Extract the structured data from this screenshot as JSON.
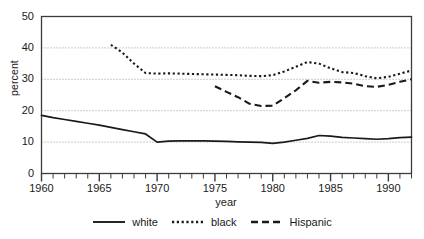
{
  "chart_data": {
    "type": "line",
    "title": "",
    "xlabel": "year",
    "ylabel": "percent",
    "xlim": [
      1960,
      1992
    ],
    "ylim": [
      0,
      50
    ],
    "yticks": [
      0,
      10,
      20,
      30,
      40,
      50
    ],
    "xticks_major": [
      1960,
      1965,
      1970,
      1975,
      1980,
      1985,
      1990
    ],
    "xticks_minor_step": 1,
    "grid": "horizontal-dotted",
    "legend_position": "below-bottom-center",
    "series": [
      {
        "name": "white",
        "style": "solid",
        "x": [
          1960,
          1961,
          1962,
          1963,
          1964,
          1965,
          1966,
          1967,
          1968,
          1969,
          1970,
          1971,
          1972,
          1973,
          1974,
          1975,
          1976,
          1977,
          1978,
          1979,
          1980,
          1981,
          1982,
          1983,
          1984,
          1985,
          1986,
          1987,
          1988,
          1989,
          1990,
          1991,
          1992
        ],
        "values": [
          18.5,
          17.8,
          17.2,
          16.6,
          16.0,
          15.4,
          14.7,
          14.0,
          13.3,
          12.6,
          10.0,
          10.3,
          10.4,
          10.4,
          10.4,
          10.3,
          10.2,
          10.1,
          10.0,
          9.9,
          9.6,
          10.0,
          10.6,
          11.2,
          12.1,
          11.9,
          11.5,
          11.3,
          11.1,
          10.9,
          11.1,
          11.4,
          11.6
        ]
      },
      {
        "name": "black",
        "style": "dotted",
        "x": [
          1966,
          1967,
          1968,
          1969,
          1970,
          1971,
          1972,
          1973,
          1974,
          1975,
          1976,
          1977,
          1978,
          1979,
          1980,
          1981,
          1982,
          1983,
          1984,
          1985,
          1986,
          1987,
          1988,
          1989,
          1990,
          1991,
          1992
        ],
        "values": [
          41.0,
          38.5,
          35.0,
          32.0,
          31.8,
          31.9,
          31.8,
          31.7,
          31.6,
          31.5,
          31.4,
          31.3,
          31.1,
          31.0,
          31.3,
          32.5,
          34.0,
          35.5,
          35.0,
          33.5,
          32.3,
          32.0,
          31.0,
          30.3,
          30.8,
          31.8,
          32.8
        ]
      },
      {
        "name": "Hispanic",
        "style": "dashed",
        "x": [
          1975,
          1976,
          1977,
          1978,
          1979,
          1980,
          1981,
          1982,
          1983,
          1984,
          1985,
          1986,
          1987,
          1988,
          1989,
          1990,
          1991,
          1992
        ],
        "values": [
          27.8,
          26.0,
          24.3,
          22.2,
          21.5,
          21.6,
          24.0,
          26.5,
          29.5,
          28.9,
          29.2,
          29.0,
          28.6,
          27.8,
          27.6,
          28.2,
          29.2,
          30.0
        ]
      }
    ]
  },
  "axes": {
    "ytick_labels": [
      "0",
      "10",
      "20",
      "30",
      "40",
      "50"
    ],
    "xtick_labels": [
      "1960",
      "1965",
      "1970",
      "1975",
      "1980",
      "1985",
      "1990"
    ],
    "ylabel_text": "percent",
    "xlabel_text": "year"
  },
  "legend": {
    "items": [
      {
        "label": "white",
        "style": "solid"
      },
      {
        "label": "black",
        "style": "dotted"
      },
      {
        "label": "Hispanic",
        "style": "dashed"
      }
    ]
  },
  "colors": {
    "line": "#1a1a1a",
    "grid": "#9a9a9a",
    "frame": "#3c3c3c",
    "background": "#ffffff"
  }
}
